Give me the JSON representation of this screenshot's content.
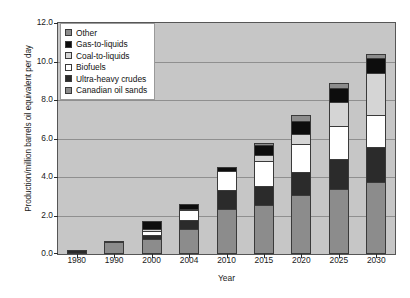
{
  "chart_data": {
    "type": "bar",
    "stacked": true,
    "title": "",
    "xlabel": "Year",
    "ylabel": "Production/million barrels oil equivalent per day",
    "categories": [
      "1980",
      "1990",
      "2000",
      "2004",
      "2010",
      "2015",
      "2020",
      "2025",
      "2030"
    ],
    "ylim": [
      0.0,
      12.0
    ],
    "yticks": [
      "0.0",
      "2.0",
      "4.0",
      "6.0",
      "8.0",
      "10.0",
      "12.0"
    ],
    "ytick_values": [
      0.0,
      2.0,
      4.0,
      6.0,
      8.0,
      10.0,
      12.0
    ],
    "grid": true,
    "legend_position": "upper left",
    "series": [
      {
        "name": "Canadian oil sands",
        "color": "#8c8c8c",
        "values": [
          0.0,
          0.6,
          0.7,
          1.25,
          2.3,
          2.5,
          3.0,
          3.3,
          3.7
        ]
      },
      {
        "name": "Ultra-heavy crudes",
        "color": "#2b2b2b",
        "values": [
          0.2,
          0.0,
          0.25,
          0.5,
          1.0,
          1.0,
          1.2,
          1.6,
          1.8
        ]
      },
      {
        "name": "Biofuels",
        "color": "#ffffff",
        "values": [
          0.0,
          0.1,
          0.2,
          0.5,
          1.0,
          1.3,
          1.5,
          1.7,
          1.7
        ]
      },
      {
        "name": "Coal-to-liquids",
        "color": "#d5d5d5",
        "values": [
          0.0,
          0.0,
          0.1,
          0.1,
          0.0,
          0.35,
          0.5,
          1.3,
          2.2
        ]
      },
      {
        "name": "Gas-to-liquids",
        "color": "#0d0d0d",
        "values": [
          0.0,
          0.0,
          0.45,
          0.25,
          0.2,
          0.5,
          0.7,
          0.7,
          0.8
        ]
      },
      {
        "name": "Other",
        "color": "#8c8c8c",
        "values": [
          0.0,
          0.0,
          0.0,
          0.0,
          0.0,
          0.1,
          0.3,
          0.3,
          0.2
        ]
      }
    ],
    "totals": [
      0.2,
      0.7,
      1.7,
      2.6,
      4.5,
      5.75,
      7.2,
      8.9,
      10.4
    ]
  },
  "legend": {
    "items": [
      {
        "label": "Other",
        "color": "#8c8c8c"
      },
      {
        "label": "Gas-to-liquids",
        "color": "#0d0d0d"
      },
      {
        "label": "Coal-to-liquids",
        "color": "#d5d5d5"
      },
      {
        "label": "Biofuels",
        "color": "#ffffff"
      },
      {
        "label": "Ultra-heavy crudes",
        "color": "#2b2b2b"
      },
      {
        "label": "Canadian oil sands",
        "color": "#8c8c8c"
      }
    ]
  },
  "style": {
    "plot_background": "#c6c6c6",
    "gridline_color": "#8f8f8f",
    "axis_color": "#565656",
    "text_color": "#1a1a1a"
  }
}
